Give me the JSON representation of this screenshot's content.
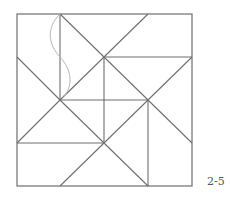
{
  "figure": {
    "label": "2-5",
    "line_color": "#6e6e6e",
    "curve_color": "#b8b8b8",
    "square": {
      "x": 17,
      "y": 14,
      "width": 175,
      "height": 172
    },
    "segments": [
      [
        60,
        14,
        60,
        100
      ],
      [
        60,
        14,
        104,
        57
      ],
      [
        104,
        57,
        148,
        14
      ],
      [
        104,
        57,
        192,
        57
      ],
      [
        104,
        57,
        148,
        100
      ],
      [
        192,
        57,
        148,
        100
      ],
      [
        104,
        57,
        104,
        143
      ],
      [
        17,
        57,
        60,
        100
      ],
      [
        60,
        100,
        104,
        57
      ],
      [
        60,
        100,
        17,
        143
      ],
      [
        60,
        100,
        104,
        143
      ],
      [
        60,
        100,
        148,
        100
      ],
      [
        17,
        143,
        104,
        143
      ],
      [
        148,
        100,
        148,
        186
      ],
      [
        148,
        100,
        192,
        143
      ],
      [
        148,
        100,
        104,
        143
      ],
      [
        104,
        143,
        148,
        186
      ],
      [
        104,
        143,
        60,
        186
      ]
    ],
    "curve": "M60,14 C46,28 48,44 60,57 C72,70 74,86 62,99"
  }
}
